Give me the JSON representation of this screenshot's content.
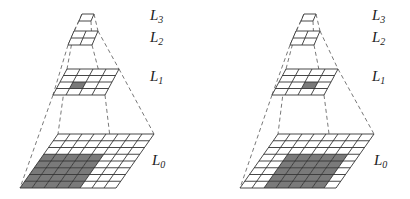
{
  "diagram": {
    "colors": {
      "line": "#333333",
      "fill": "#7a7a7a",
      "dash": "#555555",
      "bg": "#ffffff"
    },
    "pyramids": [
      {
        "name": "left",
        "levels": [
          {
            "label": "L",
            "sub": "3",
            "grid": 1,
            "shaded": []
          },
          {
            "label": "L",
            "sub": "2",
            "grid": 2,
            "shaded": []
          },
          {
            "label": "L",
            "sub": "1",
            "grid": 4,
            "shaded": [
              [
                2,
                1
              ]
            ]
          },
          {
            "label": "L",
            "sub": "0",
            "grid": 8,
            "shaded_block": {
              "row_start": 3,
              "row_end": 7,
              "col_start": 0,
              "col_end": 4
            }
          }
        ]
      },
      {
        "name": "right",
        "levels": [
          {
            "label": "L",
            "sub": "3",
            "grid": 1,
            "shaded": []
          },
          {
            "label": "L",
            "sub": "2",
            "grid": 2,
            "shaded": []
          },
          {
            "label": "L",
            "sub": "1",
            "grid": 4,
            "shaded": [
              [
                2,
                2
              ]
            ]
          },
          {
            "label": "L",
            "sub": "0",
            "grid": 8,
            "shaded_block": {
              "row_start": 3,
              "row_end": 7,
              "col_start": 2,
              "col_end": 6
            }
          }
        ]
      }
    ]
  }
}
